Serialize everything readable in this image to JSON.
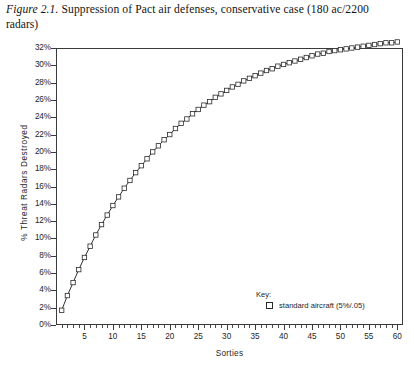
{
  "caption": {
    "figure_label": "Figure 2.1.",
    "text": "Suppression of Pact air defenses, conservative case (180 ac/2200",
    "line2": "radars)"
  },
  "axes": {
    "x_title": "Sorties",
    "y_title": "% Threat Radars Destroyed"
  },
  "legend": {
    "title": "Key:",
    "entry_label": "standard aircraft (5%/.05)",
    "marker": "open-square"
  },
  "colors": {
    "axis": "#3a3a3a",
    "series_line": "#1a1a1a",
    "marker_fill": "#ffffff",
    "marker_stroke": "#2a2a2a",
    "text": "#1e1e1e",
    "background": "#ffffff"
  },
  "chart_data": {
    "type": "line",
    "xlabel": "Sorties",
    "ylabel": "% Threat Radars Destroyed",
    "xlim": [
      0,
      61
    ],
    "ylim": [
      0,
      32
    ],
    "xticks": [
      5,
      10,
      15,
      20,
      25,
      30,
      35,
      40,
      45,
      50,
      55,
      60
    ],
    "yticks": [
      0,
      2,
      4,
      6,
      8,
      10,
      12,
      14,
      16,
      18,
      20,
      22,
      24,
      26,
      28,
      30,
      32
    ],
    "ytick_labels": [
      "0%",
      "2%",
      "4%",
      "6%",
      "8%",
      "10%",
      "12%",
      "14%",
      "16%",
      "18%",
      "20%",
      "22%",
      "24%",
      "26%",
      "28%",
      "30%",
      "32%"
    ],
    "xtick_minor_step": 1,
    "grid": false,
    "legend_position": "inside-bottom-right",
    "marker": "open-square",
    "series": [
      {
        "name": "standard aircraft (5%/.05)",
        "x": [
          1,
          2,
          3,
          4,
          5,
          6,
          7,
          8,
          9,
          10,
          11,
          12,
          13,
          14,
          15,
          16,
          17,
          18,
          19,
          20,
          21,
          22,
          23,
          24,
          25,
          26,
          27,
          28,
          29,
          30,
          31,
          32,
          33,
          34,
          35,
          36,
          37,
          38,
          39,
          40,
          41,
          42,
          43,
          44,
          45,
          46,
          47,
          48,
          49,
          50,
          51,
          52,
          53,
          54,
          55,
          56,
          57,
          58,
          59,
          60
        ],
        "values": [
          1.7,
          3.4,
          4.9,
          6.4,
          7.8,
          9.1,
          10.4,
          11.6,
          12.7,
          13.8,
          14.8,
          15.8,
          16.7,
          17.6,
          18.4,
          19.2,
          20.0,
          20.7,
          21.4,
          22.0,
          22.7,
          23.3,
          23.8,
          24.4,
          24.9,
          25.4,
          25.8,
          26.3,
          26.7,
          27.1,
          27.5,
          27.8,
          28.2,
          28.5,
          28.8,
          29.1,
          29.4,
          29.6,
          29.9,
          30.1,
          30.3,
          30.5,
          30.7,
          30.9,
          31.1,
          31.3,
          31.4,
          31.6,
          31.7,
          31.8,
          31.9,
          32.0,
          32.1,
          32.2,
          32.3,
          32.4,
          32.5,
          32.6,
          32.6,
          32.7
        ]
      }
    ]
  }
}
